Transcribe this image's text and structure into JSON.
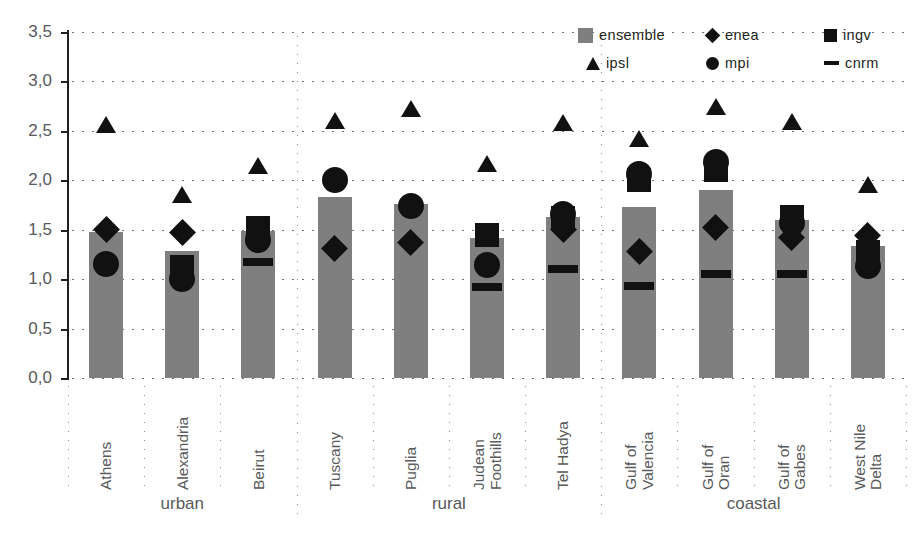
{
  "chart_data": {
    "type": "bar",
    "title": "",
    "subtitle": "",
    "xlabel": "",
    "ylabel": "",
    "ylim": [
      0.0,
      3.5
    ],
    "ytick_labels": [
      "0,0",
      "0,5",
      "1,0",
      "1,5",
      "2,0",
      "2,5",
      "3,0",
      "3,5"
    ],
    "ytick_values": [
      0.0,
      0.5,
      1.0,
      1.5,
      2.0,
      2.5,
      3.0,
      3.5
    ],
    "grid": "horizontal-dotted",
    "legend_position": "top-right",
    "decimal_separator": ",",
    "categories": [
      "Athens",
      "Alexandria",
      "Beirut",
      "Tuscany",
      "Puglia",
      "Judean Foothills",
      "Tel Hadya",
      "Gulf of Valencia",
      "Gulf of Oran",
      "Gulf of Gabes",
      "West Nile Delta"
    ],
    "category_lines": [
      [
        "Athens"
      ],
      [
        "Alexandria"
      ],
      [
        "Beirut"
      ],
      [
        "Tuscany"
      ],
      [
        "Puglia"
      ],
      [
        "Judean",
        "Foothills"
      ],
      [
        "Tel Hadya"
      ],
      [
        "Gulf of",
        "Valencia"
      ],
      [
        "Gulf of",
        "Oran"
      ],
      [
        "Gulf of",
        "Gabes"
      ],
      [
        "West Nile",
        "Delta"
      ]
    ],
    "groups": [
      {
        "label": "urban",
        "start": 0,
        "end": 2
      },
      {
        "label": "rural",
        "start": 3,
        "end": 6
      },
      {
        "label": "coastal",
        "start": 7,
        "end": 10
      }
    ],
    "series": [
      {
        "name": "ensemble",
        "marker": "bar",
        "color": "#7f7f7f",
        "values": [
          1.48,
          1.28,
          1.49,
          1.83,
          1.76,
          1.42,
          1.63,
          1.73,
          1.9,
          1.6,
          1.34
        ]
      },
      {
        "name": "enea",
        "marker": "diamond",
        "color": "#111111",
        "values": [
          1.5,
          1.47,
          null,
          1.31,
          1.37,
          null,
          1.5,
          1.28,
          1.52,
          1.42,
          1.44
        ]
      },
      {
        "name": "ingv",
        "marker": "square",
        "color": "#111111",
        "values": [
          null,
          1.12,
          1.52,
          null,
          null,
          1.45,
          1.62,
          2.0,
          2.1,
          1.63,
          1.27
        ]
      },
      {
        "name": "ipsl",
        "marker": "triangle",
        "color": "#111111",
        "values": [
          2.56,
          1.85,
          2.14,
          2.6,
          2.72,
          2.16,
          2.58,
          2.42,
          2.74,
          2.59,
          1.95
        ]
      },
      {
        "name": "mpi",
        "marker": "circle",
        "color": "#111111",
        "values": [
          1.15,
          1.0,
          1.4,
          2.0,
          1.74,
          1.14,
          1.66,
          2.06,
          2.18,
          1.57,
          1.13
        ]
      },
      {
        "name": "cnrm",
        "marker": "dash",
        "color": "#111111",
        "values": [
          null,
          null,
          1.17,
          null,
          null,
          0.92,
          1.1,
          0.93,
          1.05,
          1.05,
          null
        ]
      }
    ]
  },
  "legend": {
    "items": [
      {
        "label": "ensemble",
        "icon": "gray-square-icon"
      },
      {
        "label": "enea",
        "icon": "diamond-icon"
      },
      {
        "label": "ingv",
        "icon": "square-icon"
      },
      {
        "label": "ipsl",
        "icon": "triangle-icon"
      },
      {
        "label": "mpi",
        "icon": "circle-icon"
      },
      {
        "label": "cnrm",
        "icon": "dash-icon"
      }
    ]
  },
  "colors": {
    "bar_gray": "#7f7f7f",
    "marker_black": "#111111",
    "axis": "#231f20",
    "tick_text": "#58595b",
    "grid_dot": "#6d6e71",
    "background": "#ffffff"
  }
}
